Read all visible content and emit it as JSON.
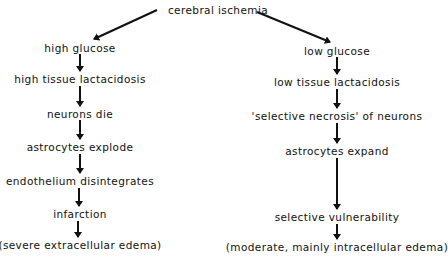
{
  "diagram": {
    "root": {
      "label": "cerebral ischemia",
      "x": 218,
      "y": 10
    },
    "left_branch": [
      {
        "label": "high glucose",
        "x": 80,
        "y": 48
      },
      {
        "label": "high tissue lactacidosis",
        "x": 80,
        "y": 79
      },
      {
        "label": "neurons die",
        "x": 80,
        "y": 114
      },
      {
        "label": "astrocytes explode",
        "x": 80,
        "y": 147
      },
      {
        "label": "endothelium disintegrates",
        "x": 80,
        "y": 181
      },
      {
        "label": "infarction",
        "x": 80,
        "y": 214
      },
      {
        "label": "(severe extracellular edema)",
        "x": 80,
        "y": 245
      }
    ],
    "right_branch": [
      {
        "label": "low glucose",
        "x": 337,
        "y": 51
      },
      {
        "label": "low tissue lactacidosis",
        "x": 337,
        "y": 82
      },
      {
        "label": "'selective necrosis' of neurons",
        "x": 337,
        "y": 116
      },
      {
        "label": "astrocytes expand",
        "x": 337,
        "y": 151
      },
      {
        "label": "selective vulnerability",
        "x": 337,
        "y": 217
      },
      {
        "label": "(moderate, mainly intracellular edema)",
        "x": 337,
        "y": 247
      }
    ],
    "arrow_color": "#111111"
  }
}
